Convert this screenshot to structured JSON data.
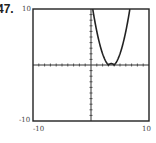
{
  "problem_number": "47.",
  "chart_data": {
    "type": "line",
    "title": "",
    "xlabel": "",
    "ylabel": "",
    "xlim": [
      -10,
      10
    ],
    "ylim": [
      -10,
      10
    ],
    "x_tick_labels": [
      "-10",
      "10"
    ],
    "y_tick_labels": [
      "10",
      "-10"
    ],
    "grid": false,
    "axis_ticks_every": 1,
    "series": [
      {
        "name": "y = |x^2 - 7x + 12|",
        "color": "#222222",
        "x": [
          0.3,
          1,
          2,
          3,
          3.5,
          4,
          5,
          6,
          6.7
        ],
        "values": [
          10,
          6,
          2,
          0,
          0.25,
          0,
          2,
          6,
          10
        ]
      }
    ]
  },
  "labels": {
    "x_min": "-10",
    "x_max": "10",
    "y_max": "10",
    "y_min": "-10"
  }
}
